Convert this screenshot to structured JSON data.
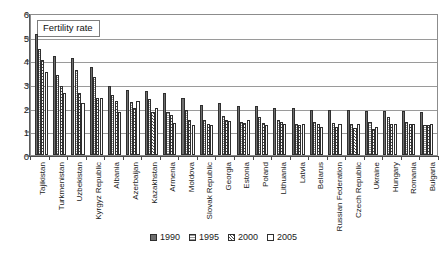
{
  "chart_data": {
    "type": "bar",
    "title": "Fertility rate",
    "xlabel": "",
    "ylabel": "",
    "ylim": [
      0,
      6
    ],
    "yticks": [
      0,
      1,
      2,
      3,
      4,
      5,
      6
    ],
    "grid": true,
    "legend_position": "bottom",
    "categories": [
      "Tajikistan",
      "Turkmenistan",
      "Uzbekistan",
      "Kyrgyz Republic",
      "Albania",
      "Azerbaijan",
      "Kazakhstan",
      "Armenia",
      "Moldova",
      "Slovak Republic",
      "Georgia",
      "Estonia",
      "Poland",
      "Lithuania",
      "Latvia",
      "Belarus",
      "Russian Federation",
      "Czech Republic",
      "Ukraine",
      "Hungary",
      "Romania",
      "Bulgaria"
    ],
    "series": [
      {
        "name": "1990",
        "values": [
          5.1,
          4.2,
          4.1,
          3.7,
          2.9,
          2.75,
          2.7,
          2.6,
          2.4,
          2.1,
          2.2,
          2.05,
          2.05,
          2.0,
          2.0,
          1.9,
          1.9,
          1.9,
          1.85,
          1.85,
          1.85,
          1.8
        ]
      },
      {
        "name": "1995",
        "values": [
          4.5,
          3.4,
          3.6,
          3.3,
          2.55,
          2.25,
          2.35,
          1.8,
          1.9,
          1.5,
          1.65,
          1.4,
          1.6,
          1.5,
          1.3,
          1.4,
          1.35,
          1.3,
          1.4,
          1.6,
          1.4,
          1.25
        ]
      },
      {
        "name": "2000",
        "values": [
          4.0,
          2.9,
          2.6,
          2.4,
          2.3,
          2.0,
          1.8,
          1.7,
          1.5,
          1.3,
          1.5,
          1.35,
          1.35,
          1.4,
          1.25,
          1.3,
          1.2,
          1.15,
          1.1,
          1.3,
          1.3,
          1.25
        ]
      },
      {
        "name": "2005",
        "values": [
          3.5,
          2.6,
          2.2,
          2.4,
          1.8,
          2.3,
          2.0,
          1.35,
          1.25,
          1.25,
          1.45,
          1.5,
          1.25,
          1.3,
          1.3,
          1.2,
          1.3,
          1.3,
          1.2,
          1.3,
          1.3,
          1.3
        ]
      }
    ]
  },
  "legend": {
    "items": [
      {
        "label": "1990",
        "swatch": "solid-dark-gray"
      },
      {
        "label": "1995",
        "swatch": "horizontal-line-fill"
      },
      {
        "label": "2000",
        "swatch": "diagonal-hatch-fill"
      },
      {
        "label": "2005",
        "swatch": "white-fill"
      }
    ]
  }
}
